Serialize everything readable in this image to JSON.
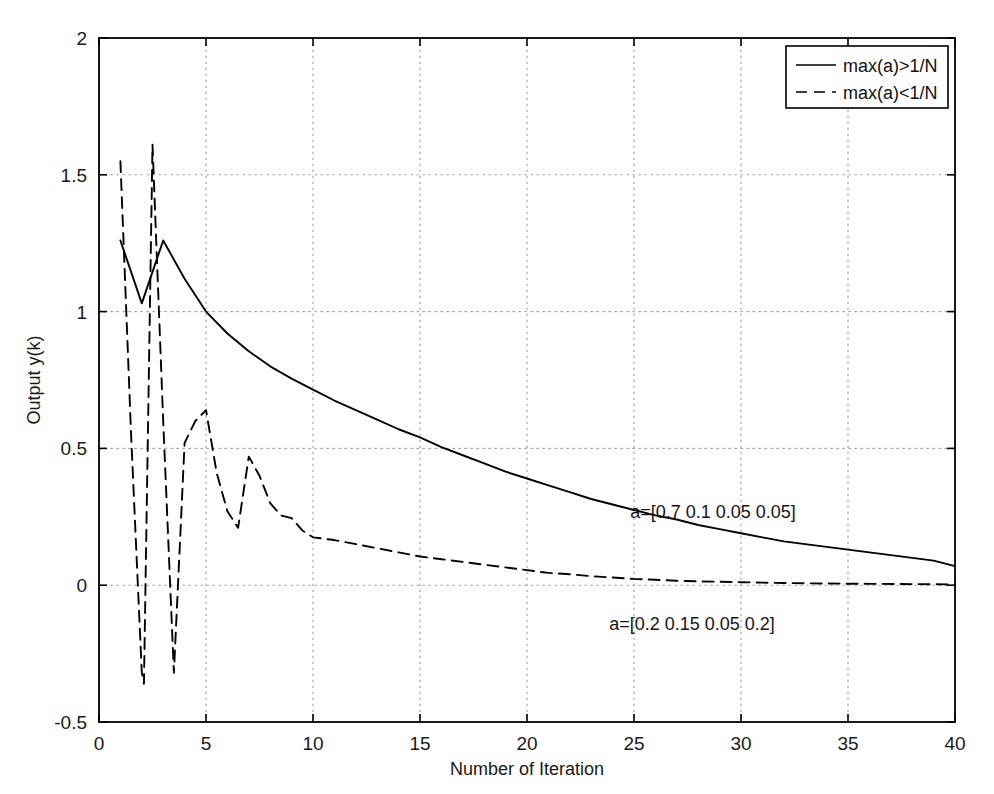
{
  "chart_data": {
    "type": "line",
    "title": "",
    "xlabel": "Number of Iteration",
    "ylabel": "Output y(k)",
    "xlim": [
      0,
      40
    ],
    "ylim": [
      -0.5,
      2
    ],
    "xticks": [
      0,
      5,
      10,
      15,
      20,
      25,
      30,
      35,
      40
    ],
    "xticklabels": [
      "0",
      "5",
      "10",
      "15",
      "20",
      "25",
      "30",
      "35",
      "40"
    ],
    "yticks": [
      -0.5,
      0,
      0.5,
      1,
      1.5,
      2
    ],
    "yticklabels": [
      "-0.5",
      "0",
      "0.5",
      "1",
      "1.5",
      "2"
    ],
    "grid": true,
    "grid_style": "dotted",
    "grid_color": "#9a9a9a",
    "axes_color": "#000000",
    "background": "#ffffff",
    "legend": {
      "position": "upper right",
      "entries": [
        {
          "label": "max(a)>1/N",
          "style": "solid"
        },
        {
          "label": "max(a)<1/N",
          "style": "dashed"
        }
      ]
    },
    "annotations": [
      {
        "text": "a=[0.7 0.1 0.05 0.05]",
        "x": 27.4,
        "y": 0.255,
        "series": "max(a)>1/N"
      },
      {
        "text": "a=[0.2 0.15 0.05 0.2]",
        "x": 26.2,
        "y": -0.155,
        "series": "max(a)<1/N"
      }
    ],
    "series": [
      {
        "name": "max(a)>1/N",
        "label": "a=[0.7 0.1 0.05 0.05]",
        "style": "solid",
        "color": "#000000",
        "x": [
          1,
          2,
          3,
          4,
          5,
          6,
          7,
          8,
          9,
          10,
          11,
          12,
          13,
          14,
          15,
          16,
          17,
          18,
          19,
          20,
          21,
          22,
          23,
          24,
          25,
          26,
          27,
          28,
          29,
          30,
          31,
          32,
          33,
          34,
          35,
          36,
          37,
          38,
          39,
          40
        ],
        "y": [
          1.26,
          1.03,
          1.26,
          1.12,
          1.0,
          0.92,
          0.855,
          0.8,
          0.755,
          0.715,
          0.675,
          0.64,
          0.605,
          0.57,
          0.54,
          0.505,
          0.475,
          0.445,
          0.415,
          0.39,
          0.365,
          0.34,
          0.315,
          0.295,
          0.275,
          0.255,
          0.24,
          0.22,
          0.205,
          0.19,
          0.175,
          0.16,
          0.15,
          0.14,
          0.13,
          0.12,
          0.11,
          0.1,
          0.09,
          0.07
        ]
      },
      {
        "name": "max(a)<1/N",
        "label": "a=[0.2 0.15 0.05 0.2]",
        "style": "dashed",
        "color": "#000000",
        "x": [
          1,
          1.5,
          2,
          2.1,
          2.5,
          3,
          3.5,
          4,
          4.5,
          5,
          5.5,
          6,
          6.5,
          7,
          7.5,
          8,
          8.5,
          9,
          9.5,
          10,
          11,
          12,
          13,
          14,
          15,
          16,
          17,
          18,
          19,
          20,
          21,
          22,
          23,
          24,
          25,
          26,
          27,
          28,
          30,
          32,
          34,
          36,
          38,
          40
        ],
        "y": [
          1.55,
          0.55,
          -0.32,
          -0.36,
          1.61,
          0.6,
          -0.32,
          0.52,
          0.6,
          0.64,
          0.41,
          0.27,
          0.21,
          0.47,
          0.4,
          0.3,
          0.255,
          0.245,
          0.2,
          0.175,
          0.165,
          0.15,
          0.135,
          0.12,
          0.105,
          0.095,
          0.085,
          0.075,
          0.065,
          0.055,
          0.045,
          0.04,
          0.033,
          0.028,
          0.023,
          0.02,
          0.016,
          0.014,
          0.011,
          0.008,
          0.006,
          0.005,
          0.004,
          0.003
        ]
      }
    ]
  },
  "axis": {
    "x_title": "Number of Iteration",
    "y_title": "Output y(k)",
    "x_tick_labels": [
      "0",
      "5",
      "10",
      "15",
      "20",
      "25",
      "30",
      "35",
      "40"
    ],
    "y_tick_labels": [
      "-0.5",
      "0",
      "0.5",
      "1",
      "1.5",
      "2"
    ]
  },
  "legend": {
    "entry_1_label": "max(a)>1/N",
    "entry_2_label": "max(a)<1/N"
  },
  "annotations": {
    "solid_curve_label": "a=[0.7 0.1 0.05 0.05]",
    "dashed_curve_label": "a=[0.2 0.15 0.05 0.2]"
  }
}
